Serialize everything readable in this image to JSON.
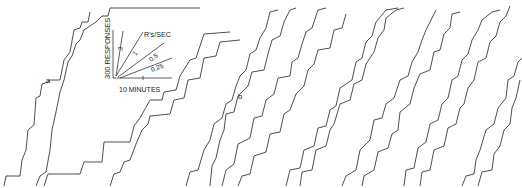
{
  "chart_data": {
    "type": "line",
    "title": "",
    "xlabel": "10 MINUTES",
    "ylabel": "300 RESPONSES",
    "inset": {
      "ylabel": "300 RESPONSES",
      "xlabel": "10 MINUTES",
      "rate_header": "R's/SEC",
      "rate_lines": [
        {
          "label": "3",
          "rate": 3
        },
        {
          "label": "1",
          "rate": 1
        },
        {
          "label": "0.5",
          "rate": 0.5
        },
        {
          "label": "0.25",
          "rate": 0.25
        }
      ]
    },
    "annotations": [
      {
        "text": "a",
        "x": 48,
        "y": 82
      },
      {
        "text": "b",
        "x": 240,
        "y": 98
      }
    ],
    "series": [
      {
        "name": "record-1",
        "points": [
          [
            4,
            186
          ],
          [
            6,
            176
          ],
          [
            20,
            176
          ],
          [
            22,
            160
          ],
          [
            26,
            150
          ],
          [
            28,
            130
          ],
          [
            34,
            125
          ],
          [
            36,
            98
          ],
          [
            40,
            96
          ],
          [
            42,
            84
          ],
          [
            48,
            82
          ],
          [
            50,
            80
          ],
          [
            60,
            80
          ],
          [
            64,
            60
          ],
          [
            70,
            52
          ],
          [
            74,
            30
          ],
          [
            80,
            28
          ],
          [
            82,
            22
          ],
          [
            88,
            22
          ],
          [
            90,
            12
          ]
        ]
      },
      {
        "name": "record-2",
        "points": [
          [
            36,
            186
          ],
          [
            40,
            176
          ],
          [
            46,
            172
          ],
          [
            50,
            150
          ],
          [
            52,
            130
          ],
          [
            56,
            112
          ],
          [
            60,
            92
          ],
          [
            64,
            80
          ],
          [
            68,
            62
          ],
          [
            72,
            56
          ],
          [
            76,
            44
          ],
          [
            80,
            40
          ],
          [
            84,
            30
          ],
          [
            90,
            26
          ],
          [
            96,
            22
          ],
          [
            102,
            16
          ],
          [
            108,
            16
          ],
          [
            110,
            8
          ],
          [
            200,
            8
          ]
        ]
      },
      {
        "name": "record-3",
        "points": [
          [
            44,
            186
          ],
          [
            48,
            174
          ],
          [
            80,
            174
          ],
          [
            84,
            162
          ],
          [
            102,
            162
          ],
          [
            104,
            142
          ],
          [
            130,
            142
          ],
          [
            134,
            126
          ],
          [
            140,
            118
          ],
          [
            150,
            100
          ],
          [
            162,
            100
          ],
          [
            164,
            92
          ],
          [
            176,
            90
          ],
          [
            180,
            76
          ],
          [
            190,
            60
          ],
          [
            196,
            58
          ],
          [
            200,
            46
          ],
          [
            204,
            34
          ],
          [
            230,
            32
          ]
        ]
      },
      {
        "name": "record-4",
        "points": [
          [
            110,
            186
          ],
          [
            114,
            174
          ],
          [
            120,
            172
          ],
          [
            124,
            162
          ],
          [
            130,
            160
          ],
          [
            136,
            144
          ],
          [
            142,
            130
          ],
          [
            148,
            124
          ],
          [
            150,
            116
          ],
          [
            170,
            114
          ],
          [
            174,
            100
          ],
          [
            184,
            98
          ],
          [
            188,
            80
          ],
          [
            200,
            78
          ],
          [
            204,
            58
          ],
          [
            216,
            56
          ],
          [
            220,
            42
          ],
          [
            240,
            40
          ]
        ]
      },
      {
        "name": "record-5",
        "points": [
          [
            186,
            186
          ],
          [
            190,
            172
          ],
          [
            198,
            170
          ],
          [
            204,
            150
          ],
          [
            210,
            140
          ],
          [
            214,
            124
          ],
          [
            222,
            118
          ],
          [
            226,
            104
          ],
          [
            232,
            100
          ],
          [
            236,
            86
          ],
          [
            240,
            76
          ],
          [
            246,
            70
          ],
          [
            250,
            54
          ],
          [
            256,
            50
          ],
          [
            260,
            38
          ],
          [
            266,
            28
          ],
          [
            270,
            12
          ],
          [
            278,
            10
          ]
        ]
      },
      {
        "name": "record-6",
        "points": [
          [
            210,
            186
          ],
          [
            212,
            166
          ],
          [
            216,
            158
          ],
          [
            220,
            140
          ],
          [
            224,
            130
          ],
          [
            226,
            114
          ],
          [
            234,
            112
          ],
          [
            238,
            96
          ],
          [
            248,
            86
          ],
          [
            252,
            72
          ],
          [
            264,
            70
          ],
          [
            268,
            54
          ],
          [
            272,
            40
          ],
          [
            280,
            36
          ],
          [
            284,
            22
          ],
          [
            290,
            10
          ],
          [
            296,
            8
          ]
        ]
      },
      {
        "name": "record-7",
        "points": [
          [
            222,
            186
          ],
          [
            226,
            170
          ],
          [
            234,
            164
          ],
          [
            238,
            144
          ],
          [
            250,
            138
          ],
          [
            254,
            118
          ],
          [
            262,
            116
          ],
          [
            266,
            100
          ],
          [
            274,
            94
          ],
          [
            278,
            78
          ],
          [
            290,
            76
          ],
          [
            292,
            62
          ],
          [
            298,
            58
          ],
          [
            302,
            44
          ],
          [
            306,
            32
          ],
          [
            312,
            28
          ],
          [
            318,
            10
          ],
          [
            326,
            8
          ]
        ]
      },
      {
        "name": "record-8",
        "points": [
          [
            238,
            186
          ],
          [
            242,
            176
          ],
          [
            250,
            174
          ],
          [
            254,
            156
          ],
          [
            266,
            152
          ],
          [
            270,
            134
          ],
          [
            280,
            132
          ],
          [
            284,
            114
          ],
          [
            290,
            110
          ],
          [
            296,
            94
          ],
          [
            304,
            86
          ],
          [
            308,
            70
          ],
          [
            314,
            64
          ],
          [
            318,
            50
          ],
          [
            330,
            48
          ],
          [
            334,
            30
          ],
          [
            342,
            28
          ],
          [
            346,
            14
          ]
        ]
      },
      {
        "name": "record-9",
        "points": [
          [
            286,
            186
          ],
          [
            290,
            170
          ],
          [
            300,
            168
          ],
          [
            304,
            150
          ],
          [
            314,
            146
          ],
          [
            318,
            128
          ],
          [
            326,
            126
          ],
          [
            330,
            110
          ],
          [
            336,
            106
          ],
          [
            340,
            88
          ],
          [
            352,
            80
          ],
          [
            356,
            62
          ],
          [
            362,
            58
          ],
          [
            366,
            42
          ],
          [
            372,
            36
          ],
          [
            376,
            22
          ],
          [
            386,
            10
          ],
          [
            398,
            8
          ]
        ]
      },
      {
        "name": "record-10",
        "points": [
          [
            300,
            186
          ],
          [
            302,
            172
          ],
          [
            312,
            170
          ],
          [
            316,
            150
          ],
          [
            326,
            146
          ],
          [
            330,
            130
          ],
          [
            334,
            124
          ],
          [
            340,
            104
          ],
          [
            350,
            100
          ],
          [
            354,
            84
          ],
          [
            362,
            80
          ],
          [
            366,
            64
          ],
          [
            374,
            52
          ],
          [
            378,
            38
          ],
          [
            384,
            30
          ],
          [
            386,
            18
          ],
          [
            396,
            10
          ],
          [
            404,
            8
          ]
        ]
      },
      {
        "name": "record-11",
        "points": [
          [
            342,
            186
          ],
          [
            346,
            176
          ],
          [
            356,
            170
          ],
          [
            360,
            150
          ],
          [
            370,
            140
          ],
          [
            374,
            120
          ],
          [
            382,
            118
          ],
          [
            386,
            104
          ],
          [
            394,
            98
          ],
          [
            400,
            80
          ],
          [
            408,
            76
          ],
          [
            412,
            62
          ],
          [
            418,
            52
          ],
          [
            422,
            40
          ],
          [
            426,
            30
          ],
          [
            430,
            22
          ],
          [
            436,
            10
          ]
        ]
      },
      {
        "name": "record-12",
        "points": [
          [
            362,
            186
          ],
          [
            364,
            176
          ],
          [
            374,
            170
          ],
          [
            378,
            152
          ],
          [
            388,
            148
          ],
          [
            392,
            134
          ],
          [
            398,
            130
          ],
          [
            400,
            112
          ],
          [
            410,
            104
          ],
          [
            414,
            88
          ],
          [
            420,
            74
          ],
          [
            430,
            70
          ],
          [
            434,
            52
          ],
          [
            440,
            50
          ],
          [
            444,
            34
          ],
          [
            450,
            28
          ],
          [
            452,
            14
          ],
          [
            460,
            12
          ]
        ]
      },
      {
        "name": "record-13",
        "points": [
          [
            404,
            186
          ],
          [
            406,
            170
          ],
          [
            414,
            168
          ],
          [
            418,
            148
          ],
          [
            426,
            142
          ],
          [
            430,
            124
          ],
          [
            438,
            120
          ],
          [
            442,
            104
          ],
          [
            448,
            98
          ],
          [
            452,
            80
          ],
          [
            458,
            76
          ],
          [
            462,
            60
          ],
          [
            468,
            54
          ],
          [
            472,
            40
          ],
          [
            478,
            30
          ],
          [
            482,
            20
          ],
          [
            492,
            12
          ],
          [
            500,
            10
          ]
        ]
      },
      {
        "name": "record-14",
        "points": [
          [
            420,
            186
          ],
          [
            422,
            172
          ],
          [
            430,
            170
          ],
          [
            434,
            150
          ],
          [
            444,
            146
          ],
          [
            448,
            128
          ],
          [
            456,
            124
          ],
          [
            460,
            108
          ],
          [
            464,
            104
          ],
          [
            468,
            88
          ],
          [
            474,
            80
          ],
          [
            478,
            62
          ],
          [
            486,
            58
          ],
          [
            490,
            42
          ],
          [
            496,
            36
          ],
          [
            500,
            22
          ],
          [
            506,
            16
          ],
          [
            510,
            6
          ]
        ]
      },
      {
        "name": "record-15",
        "points": [
          [
            462,
            186
          ],
          [
            466,
            176
          ],
          [
            474,
            174
          ],
          [
            476,
            160
          ],
          [
            480,
            150
          ],
          [
            486,
            130
          ],
          [
            494,
            124
          ],
          [
            498,
            108
          ],
          [
            506,
            98
          ],
          [
            508,
            80
          ],
          [
            514,
            76
          ],
          [
            518,
            62
          ],
          [
            522,
            58
          ]
        ]
      },
      {
        "name": "record-16",
        "points": [
          [
            478,
            186
          ],
          [
            482,
            172
          ],
          [
            492,
            170
          ],
          [
            494,
            154
          ],
          [
            500,
            146
          ],
          [
            504,
            130
          ],
          [
            510,
            124
          ],
          [
            512,
            108
          ],
          [
            516,
            98
          ],
          [
            520,
            80
          ]
        ]
      }
    ]
  }
}
